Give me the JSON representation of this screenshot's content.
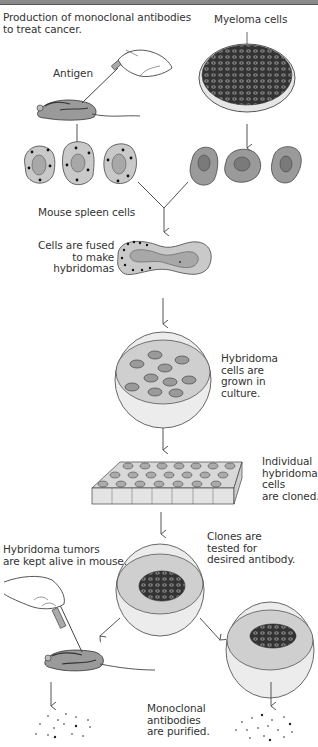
{
  "title": "Production of monoclonal antibodies\nto treat cancer.",
  "labels": {
    "antigen": "Antigen",
    "myeloma": "Myeloma cells",
    "spleen": "Mouse spleen cells",
    "fused": "Cells are fused\nto make\nhybridomas",
    "culture": "Hybridoma\ncells are\ngrown in\nculture.",
    "cloned": "Individual\nhybridoma\ncells\nare cloned.",
    "tested": "Clones are\ntested for\ndesired antibody.",
    "tumors": "Hybridoma tumors\nare kept alive in mouse.",
    "purified": "Monoclonal\nantibodies\nare purified."
  },
  "colors": {
    "cell_light": "#c9c9c9",
    "cell_dark": "#9a9a9a",
    "nucleus_light": "#a8a8a8",
    "nucleus_dark": "#7a7a7a",
    "dish_rim": "#e4e4e4",
    "dish_medium": "#cfcfcf",
    "outline": "#444444",
    "arrow": "#555555"
  },
  "steps": [
    {
      "id": "immunize",
      "label_key": "antigen"
    },
    {
      "id": "myeloma",
      "label_key": "myeloma"
    },
    {
      "id": "spleen_cells",
      "label_key": "spleen",
      "count": 3
    },
    {
      "id": "myeloma_cells",
      "count": 3
    },
    {
      "id": "fusion",
      "label_key": "fused"
    },
    {
      "id": "culture",
      "label_key": "culture"
    },
    {
      "id": "cloning",
      "label_key": "cloned",
      "grid": {
        "rows": 3,
        "cols": 7
      }
    },
    {
      "id": "testing",
      "label_key": "tested"
    },
    {
      "id": "in_vivo",
      "label_key": "tumors"
    },
    {
      "id": "purification",
      "label_key": "purified"
    }
  ]
}
